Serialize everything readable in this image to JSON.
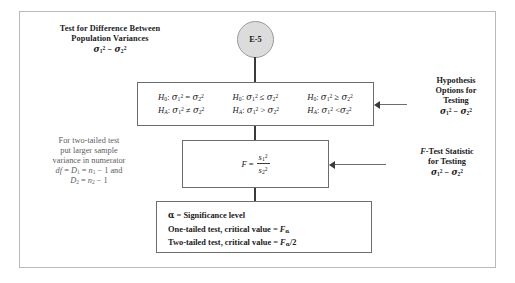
{
  "diagram": {
    "title_lines": [
      "Test for  Difference Between",
      "Population Variances"
    ],
    "title_formula": "σ₁² − σ₂²",
    "node_label": "E-5",
    "left_note_lines": [
      "For two-tailed test",
      "put larger sample",
      "variance in numerator"
    ],
    "left_note_formula_1": "df = D₁ = n₁ − 1 and",
    "left_note_formula_2": "D₂ = n₂ − 1",
    "hypothesis_note": {
      "lines": [
        "Hypothesis",
        "Options for",
        "Testing"
      ],
      "formula": "σ₁² − σ₂²"
    },
    "fstat_note": {
      "lines": [
        "F-Test Statistic",
        "for Testing"
      ],
      "formula": "σ₁² − σ₂²"
    },
    "hypothesis_options": [
      {
        "null": "H₀: σ₁² = σ₂²",
        "alt": "Hₐ: σ₁² ≠ σ₂²"
      },
      {
        "null": "H₀: σ₁² ≤ σ₂²",
        "alt": "Hₐ: σ₁² > σ₂²"
      },
      {
        "null": "H₀: σ₁² ≥ σ₂²",
        "alt": "Hₐ: σ₁² < σ₂²"
      }
    ],
    "f_statistic": {
      "lhs": "F =",
      "numerator": "s₁²",
      "denominator": "s₂²"
    },
    "alpha_box_lines": [
      "α = Significance level",
      "One-tailed test, critical value = Fα",
      "Two-tailed test, critical value = Fα/2"
    ],
    "colors": {
      "node_fill": "#dcdcdc",
      "box_border": "#6d6d6d",
      "connector": "#3b3b3b",
      "frame": "#b9b9b9",
      "note_gray": "#5d5d5d"
    }
  }
}
